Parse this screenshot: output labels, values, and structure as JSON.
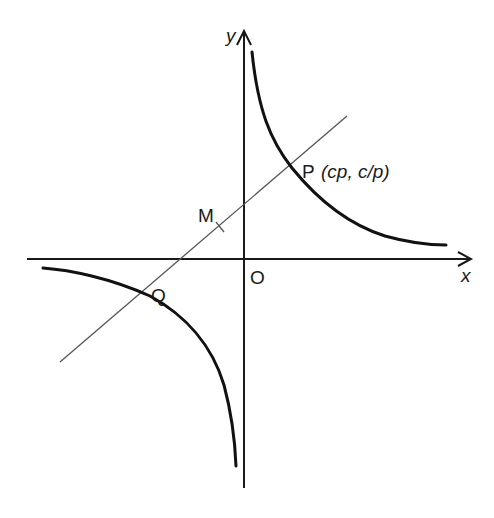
{
  "diagram": {
    "type": "rectangular hyperbola xy = c^2 with chord",
    "axes": {
      "x_label": "x",
      "y_label": "y",
      "origin_label": "O"
    },
    "points": {
      "P": {
        "label": "P",
        "coords": "(cp, c/p)"
      },
      "Q": {
        "label": "Q"
      },
      "M": {
        "label": "M"
      }
    },
    "colors": {
      "ink": "#111111",
      "line": "#555555",
      "background": "#ffffff"
    }
  }
}
